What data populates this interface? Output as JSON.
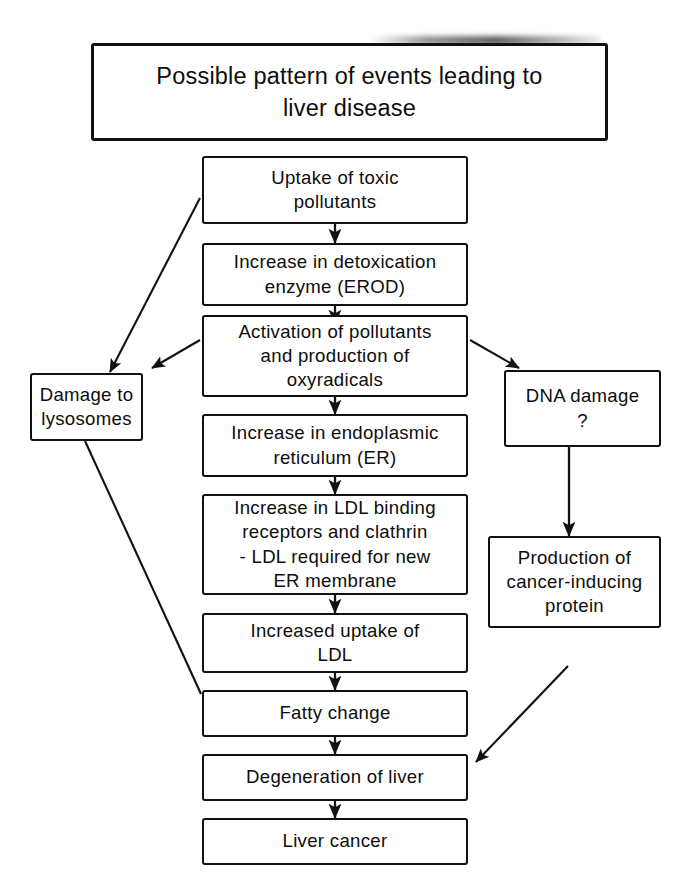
{
  "figure": {
    "kind": "flowchart",
    "title": "Possible pattern of events leading to\nliver disease",
    "background_color": "#ffffff",
    "line_color": "#111111"
  },
  "nodes": {
    "title": "Possible pattern of events leading to\nliver disease",
    "uptake": "Uptake of toxic\npollutants",
    "erod": "Increase in detoxication\nenzyme (EROD)",
    "activation": "Activation of pollutants\nand production of\noxyradicals",
    "er": "Increase in endoplasmic\nreticulum (ER)",
    "ldl_binding": "Increase in LDL binding\nreceptors and clathrin\n- LDL required for new\nER membrane",
    "ldl_uptake": "Increased uptake of\nLDL",
    "fatty": "Fatty change",
    "degeneration": "Degeneration of liver",
    "cancer": "Liver cancer",
    "lysosomes": "Damage to\nlysosomes",
    "dna": "DNA damage\n?",
    "protein": "Production of\ncancer-inducing\nprotein"
  },
  "edges": [
    {
      "from": "uptake",
      "to": "erod",
      "style": "arrow-down"
    },
    {
      "from": "erod",
      "to": "activation",
      "style": "arrow-down"
    },
    {
      "from": "activation",
      "to": "er",
      "style": "arrow-down"
    },
    {
      "from": "er",
      "to": "ldl_binding",
      "style": "arrow-down"
    },
    {
      "from": "ldl_binding",
      "to": "ldl_uptake",
      "style": "arrow-down"
    },
    {
      "from": "ldl_uptake",
      "to": "fatty",
      "style": "arrow-down"
    },
    {
      "from": "fatty",
      "to": "degeneration",
      "style": "arrow-down"
    },
    {
      "from": "degeneration",
      "to": "cancer",
      "style": "arrow-down"
    },
    {
      "from": "uptake",
      "to": "lysosomes",
      "style": "arrow-diagonal"
    },
    {
      "from": "activation",
      "to": "lysosomes",
      "style": "arrow-diagonal"
    },
    {
      "from": "activation",
      "to": "dna",
      "style": "arrow-diagonal"
    },
    {
      "from": "dna",
      "to": "protein",
      "style": "arrow-down"
    },
    {
      "from": "lysosomes",
      "to": "fatty",
      "style": "line-diagonal"
    },
    {
      "from": "protein",
      "to": "degeneration",
      "style": "arrow-diagonal"
    }
  ]
}
